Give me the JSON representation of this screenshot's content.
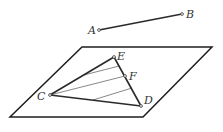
{
  "diagram": {
    "type": "geometry-figure",
    "colors": {
      "stroke": "#2a2a2a",
      "thin_stroke": "#555555",
      "background": "#ffffff"
    },
    "segment_AB": {
      "A": {
        "label": "A",
        "x": 99,
        "y": 30
      },
      "B": {
        "label": "B",
        "x": 182,
        "y": 14
      }
    },
    "plane": {
      "vertices": [
        {
          "x": 82,
          "y": 47
        },
        {
          "x": 212,
          "y": 47
        },
        {
          "x": 143,
          "y": 117
        },
        {
          "x": 10,
          "y": 117
        }
      ]
    },
    "triangle": {
      "C": {
        "label": "C",
        "x": 50,
        "y": 95
      },
      "E": {
        "label": "E",
        "x": 114,
        "y": 57
      },
      "D": {
        "label": "D",
        "x": 141,
        "y": 106
      },
      "F": {
        "label": "F",
        "x": 125,
        "y": 76
      }
    },
    "parallel_lines": [
      {
        "x1": 84,
        "y1": 75,
        "x2": 119,
        "y2": 66
      },
      {
        "x1": 50,
        "y1": 95,
        "x2": 125,
        "y2": 76
      },
      {
        "x1": 93,
        "y1": 100,
        "x2": 132,
        "y2": 88
      }
    ]
  },
  "labels": {
    "A": "A",
    "B": "B",
    "C": "C",
    "D": "D",
    "E": "E",
    "F": "F"
  }
}
